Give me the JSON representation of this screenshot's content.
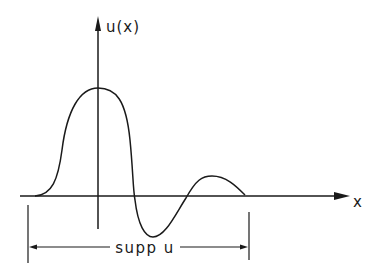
{
  "diagram": {
    "y_axis_label": "u(x)",
    "x_axis_label": "x",
    "support_label": "supp u",
    "colors": {
      "ink": "#1a1a1a",
      "background": "#ffffff"
    }
  }
}
